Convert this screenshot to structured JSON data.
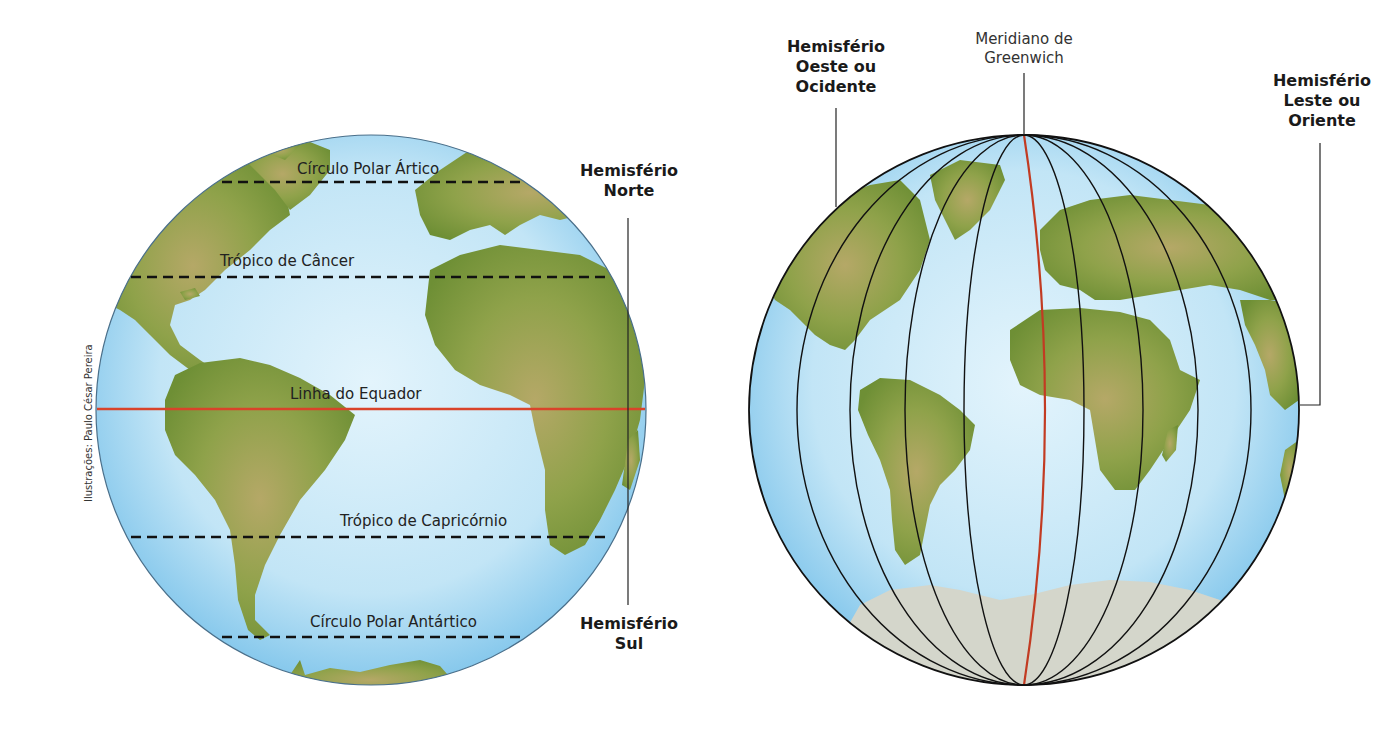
{
  "credit": "Ilustrações: Paulo César Pereira",
  "colors": {
    "ocean": "#bfe3f5",
    "ocean_edge": "#7fc4ea",
    "land": "#7b9a3c",
    "land_light": "#b3a866",
    "ice": "#d7d9cf",
    "equator_red": "#d9432a",
    "meridian_red": "#c23b22",
    "line_black": "#111111"
  },
  "left_globe": {
    "title": "Paralelos",
    "lines": [
      {
        "name": "arctic-circle",
        "label": "Círculo Polar Ártico",
        "style": "dashed"
      },
      {
        "name": "tropic-cancer",
        "label": "Trópico de Câncer",
        "style": "dashed"
      },
      {
        "name": "equator",
        "label": "Linha do Equador",
        "style": "solid-red"
      },
      {
        "name": "tropic-capricorn",
        "label": "Trópico de Capricórnio",
        "style": "dashed"
      },
      {
        "name": "antarctic-circle",
        "label": "Círculo Polar Antártico",
        "style": "dashed"
      }
    ],
    "hemisphere_north": {
      "line1": "Hemisfério",
      "line2": "Norte"
    },
    "hemisphere_south": {
      "line1": "Hemisfério",
      "line2": "Sul"
    }
  },
  "right_globe": {
    "title": "Meridianos",
    "greenwich": {
      "line1": "Meridiano de",
      "line2": "Greenwich"
    },
    "hemisphere_west": {
      "line1": "Hemisfério",
      "line2": "Oeste ou",
      "line3": "Ocidente"
    },
    "hemisphere_east": {
      "line1": "Hemisfério",
      "line2": "Leste ou",
      "line3": "Oriente"
    },
    "meridian_count": 11
  }
}
